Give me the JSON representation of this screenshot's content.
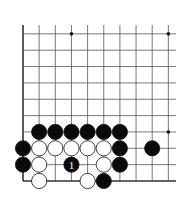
{
  "board": {
    "origin_x": 23,
    "origin_y": 181,
    "spacing_x": 16.15,
    "spacing_y": 16.35,
    "columns": 10,
    "rows": 10,
    "top_y": 25,
    "right_x": 176,
    "line_color": "#555555",
    "edge_color": "#333333"
  },
  "star_points": [
    {
      "col": 4,
      "row": 10
    },
    {
      "col": 10,
      "row": 10
    },
    {
      "col": 10,
      "row": 4
    }
  ],
  "stones": [
    {
      "color": "black",
      "col": 2,
      "row": 4
    },
    {
      "color": "black",
      "col": 3,
      "row": 4
    },
    {
      "color": "black",
      "col": 4,
      "row": 4
    },
    {
      "color": "black",
      "col": 5,
      "row": 4
    },
    {
      "color": "black",
      "col": 6,
      "row": 4
    },
    {
      "color": "black",
      "col": 7,
      "row": 4
    },
    {
      "color": "black",
      "col": 1,
      "row": 3
    },
    {
      "color": "white",
      "col": 2,
      "row": 3
    },
    {
      "color": "white",
      "col": 3,
      "row": 3
    },
    {
      "color": "white",
      "col": 4,
      "row": 3
    },
    {
      "color": "white",
      "col": 5,
      "row": 3
    },
    {
      "color": "white",
      "col": 6,
      "row": 3
    },
    {
      "color": "black",
      "col": 7,
      "row": 3
    },
    {
      "color": "black",
      "col": 9,
      "row": 3
    },
    {
      "color": "black",
      "col": 1,
      "row": 2
    },
    {
      "color": "white",
      "col": 2,
      "row": 2
    },
    {
      "color": "black",
      "col": 4,
      "row": 2,
      "label": "1"
    },
    {
      "color": "white",
      "col": 6,
      "row": 2
    },
    {
      "color": "black",
      "col": 7,
      "row": 2
    },
    {
      "color": "white",
      "col": 2,
      "row": 1
    },
    {
      "color": "white",
      "col": 5,
      "row": 1
    },
    {
      "color": "black",
      "col": 6,
      "row": 1
    }
  ],
  "move_label": "1"
}
